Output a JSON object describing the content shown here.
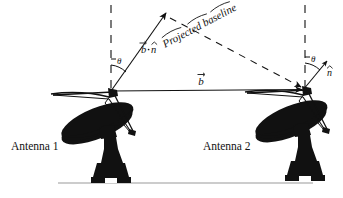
{
  "figure": {
    "background_color": "#ffffff",
    "ink_color": "#111111",
    "ground_color": "#999999"
  },
  "labels": {
    "antenna_1": "Antenna 1",
    "antenna_2": "Antenna 2",
    "projected_baseline": "Projected baseline",
    "baseline_vector": "b",
    "baseline_vector_full": "b⃗",
    "dot_product": "b⃗·n̂",
    "dot_product_b": "b",
    "dot_product_op": "·",
    "dot_product_n": "n",
    "unit_normal": "n̂",
    "unit_normal_letter": "n",
    "theta_left": "θ",
    "theta_right": "θ"
  },
  "geometry": {
    "antenna1_apex": {
      "x": 111,
      "y": 92
    },
    "antenna2_apex": {
      "x": 305,
      "y": 90
    },
    "baseline_arrow_tip": {
      "x": 305,
      "y": 90
    },
    "bn_arrow_tip": {
      "x": 167,
      "y": 12
    },
    "projected_baseline_start": {
      "x": 193,
      "y": 30
    },
    "projected_baseline_end": {
      "x": 303,
      "y": 88
    },
    "normal_arrow_tip": {
      "x": 328,
      "y": 60
    },
    "dash_line_left_x": 111,
    "dash_line_right_x": 305,
    "dash_line_top_y": 5,
    "ground_y": 183,
    "ground_x_start": 58,
    "ground_x_end": 313,
    "projected_baseline_text_angle_deg": 28,
    "theta_left_deg": 32,
    "theta_right_deg": 32
  },
  "elements": {
    "dish_count": 2,
    "strut_count": 3,
    "has_ground_line": true,
    "has_dashed_verticals": true,
    "has_dashed_projection": true
  }
}
